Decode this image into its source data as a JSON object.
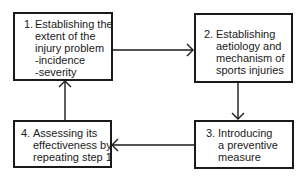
{
  "diagram": {
    "type": "cycle-flowchart",
    "steps": [
      {
        "id": 1,
        "number": "1.",
        "lines": [
          "Establishing the",
          "extent of the",
          "injury problem",
          "-incidence",
          "-severity"
        ]
      },
      {
        "id": 2,
        "number": "2.",
        "lines": [
          "Establishing",
          "aetiology and",
          "mechanism of",
          "sports injuries"
        ]
      },
      {
        "id": 3,
        "number": "3.",
        "lines": [
          "Introducing",
          "a preventive",
          "measure"
        ]
      },
      {
        "id": 4,
        "number": "4.",
        "lines": [
          "Assessing its",
          "effectiveness by",
          "repeating step 1"
        ]
      }
    ],
    "edges": [
      {
        "from": 1,
        "to": 2,
        "direction": "right"
      },
      {
        "from": 2,
        "to": 3,
        "direction": "down"
      },
      {
        "from": 3,
        "to": 4,
        "direction": "left"
      },
      {
        "from": 4,
        "to": 1,
        "direction": "up"
      }
    ],
    "colors": {
      "stroke": "#1a1a1a",
      "background": "#ffffff"
    }
  }
}
